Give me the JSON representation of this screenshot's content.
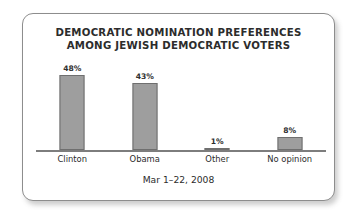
{
  "card": {
    "title_line_1": "DEMOCRATIC NOMINATION PREFERENCES",
    "title_line_2": "AMONG JEWISH DEMOCRATIC VOTERS",
    "caption": "Mar 1–22, 2008",
    "border_color": "#8d8d8d",
    "background_color": "#ffffff"
  },
  "chart_data": {
    "type": "bar",
    "title": "DEMOCRATIC NOMINATION PREFERENCES AMONG JEWISH DEMOCRATIC VOTERS",
    "subtitle": "Mar 1–22, 2008",
    "categories": [
      "Clinton",
      "Obama",
      "Other",
      "No opinion"
    ],
    "values": [
      48,
      43,
      1,
      8
    ],
    "value_labels": [
      "48%",
      "43%",
      "1%",
      "8%"
    ],
    "xlabel": "",
    "ylabel": "",
    "ylim": [
      0,
      60
    ],
    "grid": false,
    "legend": false,
    "bar_color": "#9e9e9e",
    "bar_border_color": "#6f6f6f",
    "axis_color": "#7d7d7d"
  }
}
